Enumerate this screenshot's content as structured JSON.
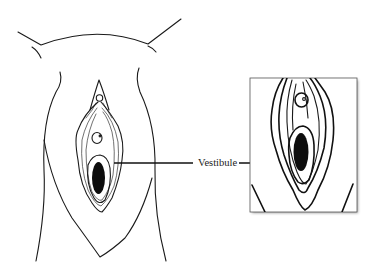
{
  "figure": {
    "labels": [
      {
        "id": "vestibule",
        "text": "Vestibule"
      }
    ],
    "colors": {
      "ink": "#111111",
      "background": "#ffffff",
      "inset_shadow": "#9a9a9a"
    }
  }
}
